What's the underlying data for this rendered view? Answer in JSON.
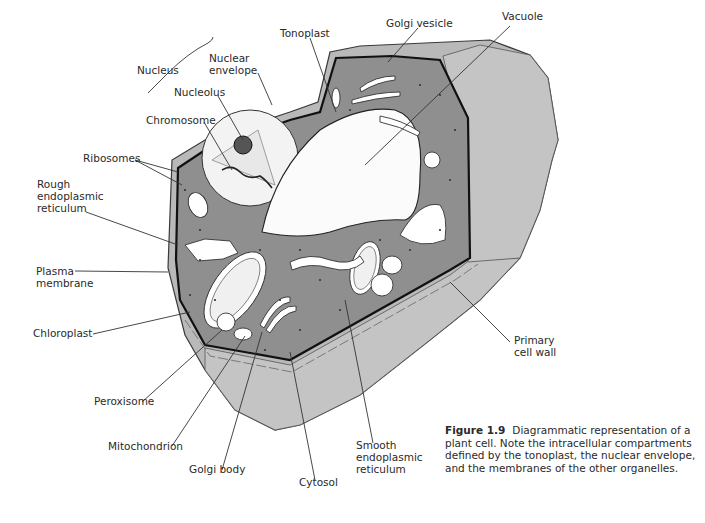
{
  "figure": {
    "number": "Figure 1.9",
    "caption": "Diagrammatic representation of a plant cell. Note the intracellular compartments defined by the tonoplast, the nuclear envelope, and the membranes of the other organelles."
  },
  "labels": {
    "nucleus": "Nucleus",
    "nuclear_envelope": [
      "Nuclear",
      "envelope"
    ],
    "tonoplast": "Tonoplast",
    "golgi_vesicle": "Golgi vesicle",
    "vacuole": "Vacuole",
    "nucleolus": "Nucleolus",
    "chromosome": "Chromosome",
    "ribosomes": "Ribosomes",
    "rough_er": [
      "Rough",
      "endoplasmic",
      "reticulum"
    ],
    "plasma_membrane": [
      "Plasma",
      "membrane"
    ],
    "chloroplast": "Chloroplast",
    "peroxisome": "Peroxisome",
    "mitochondrion": "Mitochondrion",
    "golgi_body": "Golgi body",
    "cytosol": "Cytosol",
    "smooth_er": [
      "Smooth",
      "endoplasmic",
      "reticulum"
    ],
    "primary_cell_wall": [
      "Primary",
      "cell wall"
    ]
  }
}
